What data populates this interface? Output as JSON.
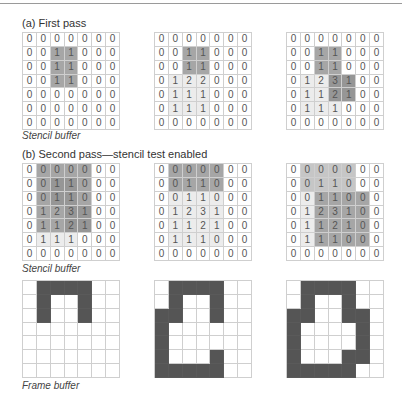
{
  "section_a": {
    "title": "(a) First pass",
    "caption": "Stencil buffer",
    "grids": [
      {
        "values": [
          [
            0,
            0,
            0,
            0,
            0,
            0,
            0
          ],
          [
            0,
            0,
            1,
            1,
            0,
            0,
            0
          ],
          [
            0,
            0,
            1,
            1,
            0,
            0,
            0
          ],
          [
            0,
            0,
            1,
            1,
            0,
            0,
            0
          ],
          [
            0,
            0,
            0,
            0,
            0,
            0,
            0
          ],
          [
            0,
            0,
            0,
            0,
            0,
            0,
            0
          ],
          [
            0,
            0,
            0,
            0,
            0,
            0,
            0
          ]
        ],
        "shade": [
          [
            0,
            0,
            0,
            0,
            0,
            0,
            0
          ],
          [
            0,
            0,
            3,
            3,
            0,
            0,
            0
          ],
          [
            0,
            0,
            3,
            3,
            0,
            0,
            0
          ],
          [
            0,
            0,
            3,
            3,
            0,
            0,
            0
          ],
          [
            0,
            0,
            0,
            0,
            0,
            0,
            0
          ],
          [
            0,
            0,
            0,
            0,
            0,
            0,
            0
          ],
          [
            0,
            0,
            0,
            0,
            0,
            0,
            0
          ]
        ]
      },
      {
        "values": [
          [
            0,
            0,
            0,
            0,
            0,
            0,
            0
          ],
          [
            0,
            0,
            1,
            1,
            0,
            0,
            0
          ],
          [
            0,
            0,
            1,
            1,
            0,
            0,
            0
          ],
          [
            0,
            1,
            2,
            2,
            0,
            0,
            0
          ],
          [
            0,
            1,
            1,
            1,
            0,
            0,
            0
          ],
          [
            0,
            1,
            1,
            1,
            0,
            0,
            0
          ],
          [
            0,
            0,
            0,
            0,
            0,
            0,
            0
          ]
        ],
        "shade": [
          [
            0,
            0,
            0,
            0,
            0,
            0,
            0
          ],
          [
            0,
            0,
            3,
            3,
            0,
            0,
            0
          ],
          [
            0,
            0,
            3,
            3,
            0,
            0,
            0
          ],
          [
            0,
            1,
            1,
            1,
            0,
            0,
            0
          ],
          [
            0,
            1,
            1,
            1,
            0,
            0,
            0
          ],
          [
            0,
            1,
            1,
            1,
            0,
            0,
            0
          ],
          [
            0,
            0,
            0,
            0,
            0,
            0,
            0
          ]
        ]
      },
      {
        "values": [
          [
            0,
            0,
            0,
            0,
            0,
            0,
            0
          ],
          [
            0,
            0,
            1,
            1,
            0,
            0,
            0
          ],
          [
            0,
            0,
            1,
            1,
            0,
            0,
            0
          ],
          [
            0,
            1,
            2,
            3,
            1,
            0,
            0
          ],
          [
            0,
            1,
            1,
            2,
            1,
            0,
            0
          ],
          [
            0,
            1,
            1,
            1,
            0,
            0,
            0
          ],
          [
            0,
            0,
            0,
            0,
            0,
            0,
            0
          ]
        ],
        "shade": [
          [
            0,
            0,
            0,
            0,
            0,
            0,
            0
          ],
          [
            0,
            0,
            3,
            3,
            0,
            0,
            0
          ],
          [
            0,
            0,
            3,
            3,
            0,
            0,
            0
          ],
          [
            0,
            1,
            1,
            4,
            4,
            0,
            0
          ],
          [
            0,
            1,
            1,
            4,
            4,
            0,
            0
          ],
          [
            0,
            1,
            1,
            1,
            0,
            0,
            0
          ],
          [
            0,
            0,
            0,
            0,
            0,
            0,
            0
          ]
        ]
      }
    ]
  },
  "section_b": {
    "title": "(b) Second pass—stencil test enabled",
    "stencil_caption": "Stencil buffer",
    "frame_caption": "Frame buffer",
    "grids": [
      {
        "values": [
          [
            0,
            0,
            0,
            0,
            0,
            0,
            0
          ],
          [
            0,
            0,
            1,
            1,
            0,
            0,
            0
          ],
          [
            0,
            0,
            1,
            1,
            0,
            0,
            0
          ],
          [
            0,
            1,
            2,
            3,
            1,
            0,
            0
          ],
          [
            0,
            1,
            1,
            2,
            1,
            0,
            0
          ],
          [
            0,
            1,
            1,
            1,
            0,
            0,
            0
          ],
          [
            0,
            0,
            0,
            0,
            0,
            0,
            0
          ]
        ],
        "shade": [
          [
            0,
            3,
            3,
            3,
            3,
            0,
            0
          ],
          [
            0,
            3,
            4,
            4,
            3,
            0,
            0
          ],
          [
            0,
            3,
            4,
            4,
            3,
            0,
            0
          ],
          [
            0,
            3,
            3,
            4,
            4,
            0,
            0
          ],
          [
            0,
            3,
            3,
            4,
            4,
            0,
            0
          ],
          [
            0,
            1,
            1,
            1,
            0,
            0,
            0
          ],
          [
            0,
            0,
            0,
            0,
            0,
            0,
            0
          ]
        ]
      },
      {
        "values": [
          [
            0,
            0,
            0,
            0,
            0,
            0,
            0
          ],
          [
            0,
            0,
            1,
            1,
            0,
            0,
            0
          ],
          [
            0,
            0,
            1,
            1,
            0,
            0,
            0
          ],
          [
            0,
            1,
            2,
            3,
            1,
            0,
            0
          ],
          [
            0,
            1,
            1,
            2,
            1,
            0,
            0
          ],
          [
            0,
            1,
            1,
            1,
            0,
            0,
            0
          ],
          [
            0,
            0,
            0,
            0,
            0,
            0,
            0
          ]
        ],
        "shade": [
          [
            0,
            3,
            3,
            3,
            3,
            0,
            0
          ],
          [
            0,
            3,
            3,
            3,
            3,
            0,
            0
          ],
          [
            0,
            1,
            1,
            1,
            1,
            0,
            0
          ],
          [
            0,
            1,
            1,
            1,
            1,
            0,
            0
          ],
          [
            0,
            1,
            1,
            1,
            1,
            0,
            0
          ],
          [
            0,
            1,
            1,
            1,
            1,
            0,
            0
          ],
          [
            0,
            0,
            0,
            0,
            0,
            0,
            0
          ]
        ]
      },
      {
        "values": [
          [
            0,
            0,
            0,
            0,
            0,
            0,
            0
          ],
          [
            0,
            0,
            1,
            1,
            0,
            0,
            0
          ],
          [
            0,
            0,
            1,
            1,
            0,
            0,
            0
          ],
          [
            0,
            1,
            2,
            3,
            1,
            0,
            0
          ],
          [
            0,
            1,
            1,
            2,
            1,
            0,
            0
          ],
          [
            0,
            1,
            1,
            1,
            0,
            0,
            0
          ],
          [
            0,
            0,
            0,
            0,
            0,
            0,
            0
          ]
        ],
        "shade": [
          [
            0,
            2,
            2,
            2,
            2,
            0,
            0
          ],
          [
            0,
            2,
            2,
            2,
            2,
            0,
            0
          ],
          [
            0,
            1,
            3,
            3,
            3,
            3,
            0
          ],
          [
            0,
            1,
            3,
            3,
            3,
            3,
            0
          ],
          [
            0,
            1,
            3,
            3,
            3,
            3,
            0
          ],
          [
            0,
            1,
            3,
            3,
            3,
            3,
            0
          ],
          [
            0,
            0,
            0,
            0,
            0,
            0,
            0
          ]
        ]
      }
    ],
    "frames": [
      [
        [
          0,
          1,
          1,
          1,
          1,
          0,
          0
        ],
        [
          0,
          1,
          0,
          0,
          1,
          0,
          0
        ],
        [
          0,
          1,
          0,
          0,
          1,
          0,
          0
        ],
        [
          0,
          0,
          0,
          0,
          0,
          0,
          0
        ],
        [
          0,
          0,
          0,
          0,
          0,
          0,
          0
        ],
        [
          0,
          0,
          0,
          0,
          0,
          0,
          0
        ],
        [
          0,
          0,
          0,
          0,
          0,
          0,
          0
        ]
      ],
      [
        [
          0,
          1,
          1,
          1,
          1,
          0,
          0
        ],
        [
          0,
          1,
          0,
          0,
          1,
          0,
          0
        ],
        [
          1,
          1,
          0,
          0,
          1,
          0,
          0
        ],
        [
          1,
          0,
          0,
          0,
          0,
          0,
          0
        ],
        [
          1,
          0,
          0,
          0,
          0,
          0,
          0
        ],
        [
          1,
          0,
          0,
          0,
          1,
          0,
          0
        ],
        [
          1,
          1,
          1,
          1,
          1,
          0,
          0
        ]
      ],
      [
        [
          0,
          1,
          1,
          1,
          1,
          0,
          0
        ],
        [
          0,
          1,
          0,
          0,
          1,
          0,
          0
        ],
        [
          1,
          1,
          0,
          0,
          1,
          1,
          0
        ],
        [
          1,
          0,
          0,
          0,
          0,
          1,
          0
        ],
        [
          1,
          0,
          0,
          0,
          0,
          1,
          0
        ],
        [
          1,
          0,
          0,
          0,
          1,
          1,
          0
        ],
        [
          1,
          1,
          1,
          1,
          1,
          0,
          0
        ]
      ]
    ]
  }
}
